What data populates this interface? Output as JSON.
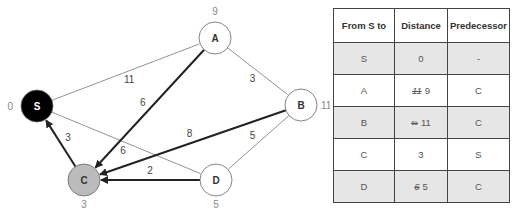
{
  "graph": {
    "nodes": [
      {
        "id": "S",
        "dist": "0",
        "x": 37,
        "y": 106,
        "fill": "#000000",
        "text": "#ffffff"
      },
      {
        "id": "A",
        "dist": "9",
        "x": 215,
        "y": 38,
        "fill": "#ffffff",
        "text": "#333333"
      },
      {
        "id": "B",
        "dist": "11",
        "x": 301,
        "y": 105,
        "fill": "#ffffff",
        "text": "#333333"
      },
      {
        "id": "C",
        "dist": "3",
        "x": 84,
        "y": 180,
        "fill": "#bbbbbb",
        "text": "#333333"
      },
      {
        "id": "D",
        "dist": "5",
        "x": 216,
        "y": 180,
        "fill": "#ffffff",
        "text": "#333333"
      }
    ],
    "edges": [
      {
        "from": "S",
        "to": "A",
        "w": "11",
        "bold": false
      },
      {
        "from": "S",
        "to": "D",
        "w": "6",
        "bold": false
      },
      {
        "from": "A",
        "to": "B",
        "w": "3",
        "bold": false
      },
      {
        "from": "B",
        "to": "D",
        "w": "5",
        "bold": false
      },
      {
        "from": "A",
        "to": "C",
        "w": "6",
        "bold": true
      },
      {
        "from": "B",
        "to": "C",
        "w": "8",
        "bold": true
      },
      {
        "from": "D",
        "to": "C",
        "w": "2",
        "bold": true
      },
      {
        "from": "C",
        "to": "S",
        "w": "3",
        "bold": true
      }
    ]
  },
  "table": {
    "headers": [
      "From S to",
      "Distance",
      "Predecessor"
    ],
    "rows": [
      {
        "node": "S",
        "old": "",
        "dist": "0",
        "pred": "-"
      },
      {
        "node": "A",
        "old": "11",
        "dist": "9",
        "pred": "C"
      },
      {
        "node": "B",
        "old": "∞",
        "dist": "11",
        "pred": "C"
      },
      {
        "node": "C",
        "old": "",
        "dist": "3",
        "pred": "S"
      },
      {
        "node": "D",
        "old": "6",
        "dist": "5",
        "pred": "C"
      }
    ]
  }
}
